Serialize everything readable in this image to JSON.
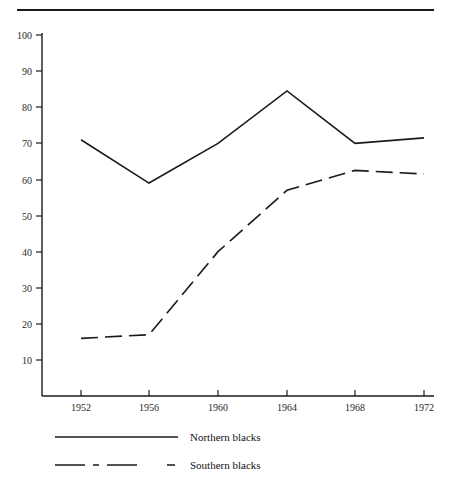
{
  "figure": {
    "has_top_rule": true,
    "background_color": "#ffffff",
    "ink_color": "#1a1a1a"
  },
  "chart_data": {
    "type": "line",
    "title": "",
    "subtitle": "",
    "xlabel": "",
    "ylabel": "",
    "categories": [
      "1952",
      "1956",
      "1960",
      "1964",
      "1968",
      "1972"
    ],
    "x": [
      1952,
      1956,
      1960,
      1964,
      1968,
      1972
    ],
    "series": [
      {
        "name": "Northern blacks",
        "style": "solid",
        "values": [
          71,
          59,
          70,
          84.5,
          70,
          71.5
        ]
      },
      {
        "name": "Southern blacks",
        "style": "dashed",
        "values": [
          16,
          17,
          40,
          57,
          62.5,
          61.5
        ]
      }
    ],
    "ylim": [
      0,
      100
    ],
    "ytick_labels": [
      "10",
      "20",
      "30",
      "40",
      "50",
      "60",
      "70",
      "80",
      "90",
      "100"
    ],
    "ytick_values": [
      10,
      20,
      30,
      40,
      50,
      60,
      70,
      80,
      90,
      100
    ],
    "xtick_labels": [
      "1952",
      "1956",
      "1960",
      "1964",
      "1968",
      "1972"
    ],
    "grid": false,
    "legend_position": "below-axis-left"
  },
  "legend": {
    "entries": [
      {
        "label": "Northern blacks",
        "style": "solid"
      },
      {
        "label": "Southern blacks",
        "style": "dashed"
      }
    ]
  }
}
